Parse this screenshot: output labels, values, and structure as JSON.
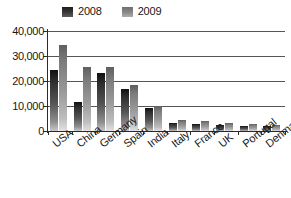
{
  "chart_data": {
    "type": "bar",
    "title": "",
    "xlabel": "",
    "ylabel": "",
    "ylim": [
      0,
      40000
    ],
    "yticks": [
      0,
      10000,
      20000,
      30000,
      40000
    ],
    "ytick_labels": [
      "0",
      "10,000",
      "20,000",
      "30,000",
      "40,000"
    ],
    "grid": true,
    "legend_position": "top",
    "categories": [
      "USA",
      "China",
      "Germany",
      "Spain",
      "India",
      "Italy",
      "France",
      "UK",
      "Portugal",
      "Denmark"
    ],
    "series": [
      {
        "name": "2008",
        "color": "#2e2e2e",
        "values": [
          24500,
          11600,
          23200,
          16800,
          9200,
          3400,
          2800,
          2300,
          2100,
          1900
        ]
      },
      {
        "name": "2009",
        "color": "#9a9a9a",
        "values": [
          34500,
          25600,
          25600,
          18300,
          10200,
          4400,
          3900,
          3100,
          2800,
          2600
        ]
      }
    ]
  },
  "legend": {
    "entries": [
      {
        "label": "2008",
        "swatch": "legend-swatch-2008"
      },
      {
        "label": "2009",
        "swatch": "legend-swatch-2009"
      }
    ]
  }
}
